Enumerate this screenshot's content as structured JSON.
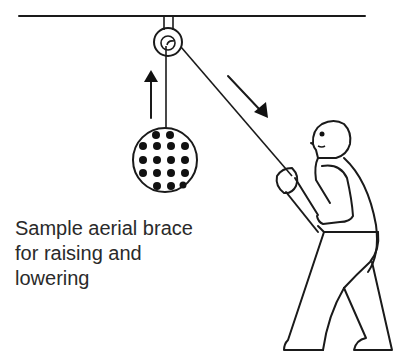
{
  "diagram": {
    "caption_lines": [
      "Sample aerial brace",
      "for raising and",
      "lowering"
    ],
    "elements": {
      "beam": "overhead-beam",
      "pulley": "pulley-block",
      "load": "aerial-brace-sample (dotted sphere)",
      "person": "worker-pulling-rope",
      "up_arrow": "load-rises",
      "down_arrow": "rope-pulled-down"
    },
    "colors": {
      "line": "#1a1a1a",
      "text": "#2a2a2a",
      "background": "#ffffff"
    }
  }
}
